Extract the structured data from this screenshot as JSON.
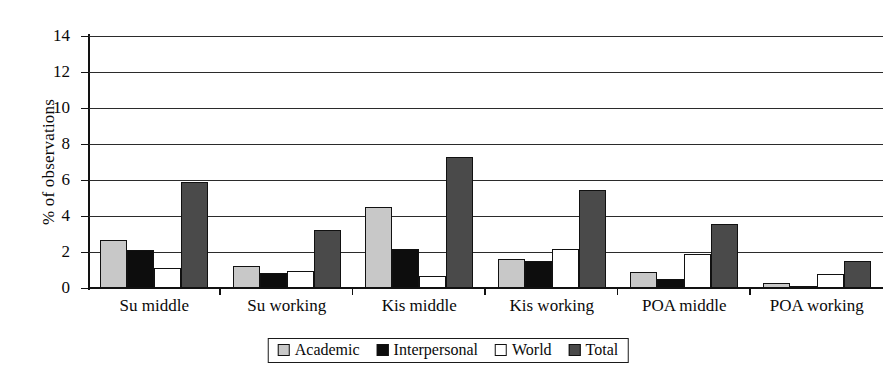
{
  "chart_data": {
    "type": "bar",
    "title": "",
    "xlabel": "",
    "ylabel": "% of observations",
    "ylim": [
      0,
      14
    ],
    "ytick_labels": [
      "14",
      "12",
      "10",
      "8",
      "6",
      "4",
      "2",
      "0"
    ],
    "ytick_values": [
      14,
      12,
      10,
      8,
      6,
      4,
      2,
      0
    ],
    "grid": true,
    "legend_position": "bottom-center",
    "categories": [
      "Su middle",
      "Su working",
      "Kis middle",
      "Kis working",
      "POA middle",
      "POA working"
    ],
    "series": [
      {
        "name": "Academic",
        "color": "#c8c8c8",
        "values": [
          2.65,
          1.2,
          4.5,
          1.6,
          0.9,
          0.3
        ]
      },
      {
        "name": "Interpersonal",
        "color": "#0d0d0d",
        "values": [
          2.1,
          0.85,
          2.15,
          1.5,
          0.5,
          0.1
        ]
      },
      {
        "name": "World",
        "color": "#ffffff",
        "values": [
          1.1,
          0.95,
          0.65,
          2.15,
          1.9,
          0.8
        ]
      },
      {
        "name": "Total",
        "color": "#4a4a4a",
        "values": [
          5.9,
          3.2,
          7.3,
          5.45,
          3.55,
          1.5
        ]
      }
    ]
  },
  "legend": {
    "items": [
      {
        "label": "Academic",
        "swatch": "academic"
      },
      {
        "label": "Interpersonal",
        "swatch": "interpersonal"
      },
      {
        "label": "World",
        "swatch": "world"
      },
      {
        "label": "Total",
        "swatch": "total"
      }
    ]
  }
}
